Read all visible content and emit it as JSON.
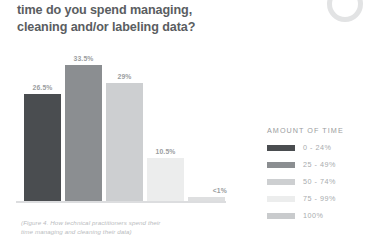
{
  "title": {
    "line1": "time do you spend managing,",
    "line2": "cleaning and/or labeling data?"
  },
  "caption": {
    "line1": "(Figure 4. How technical practitioners spend their",
    "line2": "time managing and cleaning their data)"
  },
  "legend": {
    "heading": "AMOUNT OF TIME",
    "items": [
      {
        "label": "0 - 24%",
        "color": "#4a4d50"
      },
      {
        "label": "25 - 49%",
        "color": "#8b8e91"
      },
      {
        "label": "50 - 74%",
        "color": "#cdcfd1"
      },
      {
        "label": "75 - 99%",
        "color": "#eceded"
      },
      {
        "label": "100%",
        "color": "#c9cbcd"
      }
    ]
  },
  "chart_data": {
    "type": "bar",
    "title": "time do you spend managing, cleaning and/or labeling data?",
    "xlabel": "",
    "ylabel": "",
    "ylim": [
      0,
      36
    ],
    "grid": false,
    "legend_position": "right",
    "categories": [
      "0 - 24%",
      "25 - 49%",
      "50 - 74%",
      "75 - 99%",
      "100%"
    ],
    "values": [
      26.5,
      33.5,
      29,
      10.5,
      0.5
    ],
    "value_labels": [
      "26.5%",
      "33.5%",
      "29%",
      "10.5%",
      "<1%"
    ],
    "colors": [
      "#4a4d50",
      "#8b8e91",
      "#cdcfd1",
      "#eceded",
      "#dedfe0"
    ],
    "series_name": "Amount of time",
    "annotation": "(Figure 4. How technical practitioners spend their time managing and cleaning their data)"
  }
}
